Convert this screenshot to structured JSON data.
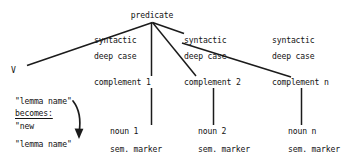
{
  "diagram": {
    "root": {
      "label": "predicate",
      "x": 152,
      "y": 12
    },
    "left_branch_leaf": {
      "label": "V",
      "x": 12,
      "y": 66
    },
    "columns": [
      {
        "id": "col-1",
        "syntactic_label": "syntactic",
        "deep_case_label": "deep case",
        "complement_label": "complement 1",
        "noun_label": "noun 1",
        "sem_marker_label": "sem. marker",
        "x": 96
      },
      {
        "id": "col-2",
        "syntactic_label": "syntactic",
        "deep_case_label": "deep case",
        "complement_label": "complement 2",
        "noun_label": "noun 2",
        "sem_marker_label": "sem. marker",
        "x": 186
      },
      {
        "id": "col-n",
        "syntactic_label": "syntactic",
        "deep_case_label": "deep case",
        "complement_label": "complement n",
        "noun_label": "noun n",
        "sem_marker_label": "sem. marker",
        "x": 276
      }
    ],
    "annotation": {
      "line1": "\"lemma name\"",
      "line2": "becomes:",
      "line3": "\"new",
      "line4": "\"lemma name\"",
      "arrow": "curved-down-left-arrow"
    },
    "style": {
      "line_color": "#1b1b1b",
      "text_color": "#131313",
      "background": "#ffffff"
    }
  }
}
